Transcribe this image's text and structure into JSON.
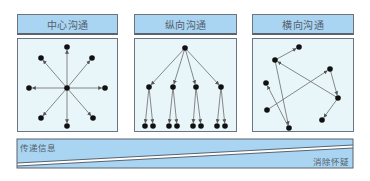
{
  "panels": [
    {
      "title": "中心沟通",
      "type": "central",
      "header": {
        "x": 17,
        "y": 14,
        "w": 101,
        "h": 22
      },
      "body": {
        "x": 17,
        "y": 38,
        "w": 101,
        "h": 94
      },
      "center": [
        67,
        88
      ],
      "nodes": [
        [
          67,
          47
        ],
        [
          41,
          58
        ],
        [
          92,
          58
        ],
        [
          29,
          88
        ],
        [
          105,
          88
        ],
        [
          41,
          118
        ],
        [
          93,
          118
        ],
        [
          67,
          126
        ]
      ]
    },
    {
      "title": "纵向沟通",
      "type": "vertical",
      "header": {
        "x": 134,
        "y": 14,
        "w": 103,
        "h": 22
      },
      "body": {
        "x": 134,
        "y": 38,
        "w": 103,
        "h": 94
      },
      "root": [
        185,
        48
      ],
      "middle": [
        [
          149,
          87
        ],
        [
          173,
          87
        ],
        [
          196,
          87
        ],
        [
          221,
          87
        ]
      ],
      "leaves": [
        [
          145,
          126
        ],
        [
          153,
          126
        ],
        [
          169,
          126
        ],
        [
          177,
          126
        ],
        [
          193,
          126
        ],
        [
          201,
          126
        ],
        [
          217,
          126
        ],
        [
          225,
          126
        ]
      ]
    },
    {
      "title": "横向沟通",
      "type": "horizontal",
      "header": {
        "x": 252,
        "y": 14,
        "w": 102,
        "h": 22
      },
      "body": {
        "x": 252,
        "y": 38,
        "w": 102,
        "h": 94
      },
      "nodes": {
        "a": [
          299,
          47
        ],
        "b": [
          275,
          60
        ],
        "c": [
          330,
          69
        ],
        "d": [
          266,
          83
        ],
        "e": [
          338,
          98
        ],
        "f": [
          267,
          110
        ],
        "g": [
          322,
          120
        ],
        "h": [
          289,
          128
        ]
      },
      "edges": [
        [
          "b",
          "a"
        ],
        [
          "e",
          "b"
        ],
        [
          "c",
          "e"
        ],
        [
          "e",
          "g"
        ],
        [
          "f",
          "c"
        ],
        [
          "b",
          "h"
        ],
        [
          "h",
          "d"
        ]
      ]
    }
  ],
  "band": {
    "top_label": "传递信息",
    "bottom_label": "消除怀疑",
    "fill": "#a9d5f2",
    "border": "#5a636e"
  },
  "colors": {
    "node": "#111111",
    "edge": "#6b6b6b",
    "header_fill": "#a9d5f2",
    "body_fill": "#e8f6fa"
  }
}
